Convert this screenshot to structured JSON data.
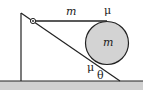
{
  "diagram": {
    "labels": {
      "string_mass": "m",
      "top_friction": "μ",
      "ball_mass": "m",
      "incline_friction": "μ",
      "angle": "θ"
    },
    "colors": {
      "line": "#222222",
      "ball_fill": "#d3d3d3",
      "ground_fill": "#d0d0d0"
    }
  }
}
